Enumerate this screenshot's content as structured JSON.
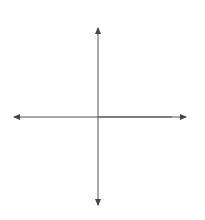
{
  "chart_data": {
    "type": "line",
    "title": "",
    "xlabel": "x",
    "ylabel": "y",
    "xlim": [
      -10,
      10
    ],
    "ylim": [
      -10,
      10
    ],
    "grid": true,
    "series": [
      {
        "name": "line-1",
        "equation": "y = 2x",
        "points": [
          [
            -10,
            -20
          ],
          [
            10,
            20
          ]
        ],
        "color": "#707070"
      },
      {
        "name": "line-2",
        "equation": "y = -2x + 10",
        "points": [
          [
            -10,
            30
          ],
          [
            10,
            -10
          ]
        ],
        "color": "#4a4a4a"
      }
    ],
    "marked_points": [
      {
        "label": "origin",
        "x": 0,
        "y": 0
      },
      {
        "label": "x-intercept",
        "x": 5,
        "y": 0
      },
      {
        "label": "intersection",
        "x": 2.5,
        "y": 5
      }
    ]
  },
  "axes": {
    "x_label": "x",
    "y_label": "y"
  },
  "colors": {
    "grid_bg": "#e6e6e6",
    "grid_line": "#f6f6f6",
    "axis": "#555555"
  }
}
